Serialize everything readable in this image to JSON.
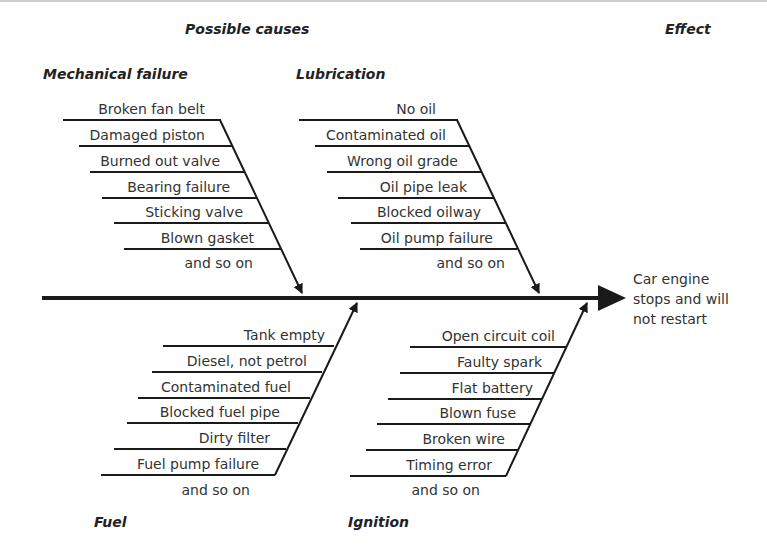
{
  "diagram": {
    "type": "fishbone (cause and effect) diagram",
    "header": {
      "causes_title": "Possible causes",
      "effect_title": "Effect"
    },
    "effect": {
      "lines": [
        "Car engine",
        "stops and will",
        "not restart"
      ]
    },
    "categories": [
      {
        "id": "mechanical",
        "title": "Mechanical failure",
        "position": "top",
        "causes": [
          "Broken fan belt",
          "Damaged piston",
          "Burned out valve",
          "Bearing failure",
          "Sticking valve",
          "Blown gasket"
        ],
        "more": "and so on"
      },
      {
        "id": "lubrication",
        "title": "Lubrication",
        "position": "top",
        "causes": [
          "No oil",
          "Contaminated oil",
          "Wrong oil grade",
          "Oil pipe leak",
          "Blocked oilway",
          "Oil pump failure"
        ],
        "more": "and so on"
      },
      {
        "id": "fuel",
        "title": "Fuel",
        "position": "bottom",
        "causes": [
          "Tank empty",
          "Diesel, not petrol",
          "Contaminated fuel",
          "Blocked fuel pipe",
          "Dirty filter",
          "Fuel pump failure"
        ],
        "more": "and so on"
      },
      {
        "id": "ignition",
        "title": "Ignition",
        "position": "bottom",
        "causes": [
          "Open circuit coil",
          "Faulty spark",
          "Flat battery",
          "Blown fuse",
          "Broken wire",
          "Timing error"
        ],
        "more": "and so on"
      }
    ],
    "colors": {
      "line": "#1a1a1a",
      "text": "#333333",
      "heading": "#222222",
      "background": "#ffffff"
    }
  }
}
